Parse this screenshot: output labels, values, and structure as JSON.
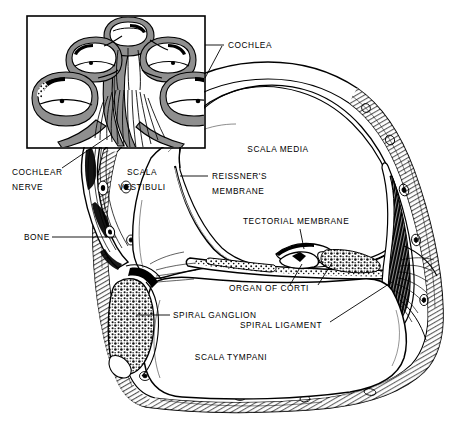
{
  "figure": {
    "type": "anatomical-line-drawing",
    "background_color": "#ffffff",
    "ink_color": "#000000",
    "shading_color": "#8f8f8f",
    "width": 460,
    "height": 426
  },
  "inset": {
    "name": "cochlea-overview-inset",
    "box": {
      "x": 27,
      "y": 16,
      "width": 178,
      "height": 132
    },
    "description": "Boxed inset showing whole spiral cochlea with 2.5 turns and nerve fibers radiating from the modiolus"
  },
  "labels": [
    {
      "id": "cochlea",
      "text": "COCHLEA",
      "lines": [
        "COCHLEA"
      ],
      "x": 228,
      "y": 48,
      "anchor": "start"
    },
    {
      "id": "cochlear-nerve",
      "text": "COCHLEAR NERVE",
      "lines": [
        "COCHLEAR",
        "NERVE"
      ],
      "x": 12,
      "y": 175,
      "anchor": "start"
    },
    {
      "id": "scala-vestibuli",
      "text": "SCALA VESTIBULI",
      "lines": [
        "SCALA",
        "VESTIBULI"
      ],
      "x": 142,
      "y": 175,
      "anchor": "middle"
    },
    {
      "id": "scala-media",
      "text": "SCALA MEDIA",
      "lines": [
        "SCALA MEDIA"
      ],
      "x": 278,
      "y": 152,
      "anchor": "middle"
    },
    {
      "id": "reissners-membrane",
      "text": "REISSNER'S MEMBRANE",
      "lines": [
        "REISSNER'S",
        "MEMBRANE"
      ],
      "x": 212,
      "y": 179,
      "anchor": "start"
    },
    {
      "id": "tectorial-membrane",
      "text": "TECTORIAL MEMBRANE",
      "lines": [
        "TECTORIAL MEMBRANE"
      ],
      "x": 243,
      "y": 224,
      "anchor": "start"
    },
    {
      "id": "bone",
      "text": "BONE",
      "lines": [
        "BONE"
      ],
      "x": 24,
      "y": 240,
      "anchor": "start"
    },
    {
      "id": "organ-of-corti",
      "text": "ORGAN OF CORTI",
      "lines": [
        "ORGAN OF CORTI"
      ],
      "x": 269,
      "y": 291,
      "anchor": "middle"
    },
    {
      "id": "spiral-ganglion",
      "text": "SPIRAL GANGLION",
      "lines": [
        "SPIRAL GANGLION"
      ],
      "x": 173,
      "y": 318,
      "anchor": "start"
    },
    {
      "id": "spiral-ligament",
      "text": "SPIRAL LIGAMENT",
      "lines": [
        "SPIRAL LIGAMENT"
      ],
      "x": 281,
      "y": 328,
      "anchor": "middle"
    },
    {
      "id": "scala-tympani",
      "text": "SCALA TYMPANI",
      "lines": [
        "SCALA TYMPANI"
      ],
      "x": 231,
      "y": 360,
      "anchor": "middle"
    }
  ],
  "structures": [
    {
      "id": "scala-vestibuli-chamber",
      "label": "SCALA VESTIBULI"
    },
    {
      "id": "scala-media-chamber",
      "label": "SCALA MEDIA"
    },
    {
      "id": "scala-tympani-chamber",
      "label": "SCALA TYMPANI"
    },
    {
      "id": "reissners-membrane-line",
      "label": "REISSNER'S MEMBRANE"
    },
    {
      "id": "basilar-membrane-line",
      "label": "BASILAR MEMBRANE"
    },
    {
      "id": "organ-of-corti-body",
      "label": "ORGAN OF CORTI"
    },
    {
      "id": "tectorial-membrane-body",
      "label": "TECTORIAL MEMBRANE"
    },
    {
      "id": "spiral-ganglion-body",
      "label": "SPIRAL GANGLION"
    },
    {
      "id": "spiral-ligament-body",
      "label": "SPIRAL LIGAMENT"
    },
    {
      "id": "bone-wall",
      "label": "BONE"
    },
    {
      "id": "cochlear-nerve-bundle",
      "label": "COCHLEAR NERVE"
    }
  ]
}
